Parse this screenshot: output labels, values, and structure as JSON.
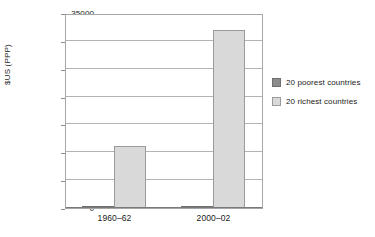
{
  "chart_data": {
    "type": "bar",
    "title": "",
    "xlabel": "",
    "ylabel": "$US (PPP)",
    "categories": [
      "1960–62",
      "2000–02"
    ],
    "series": [
      {
        "name": "20 poorest countries",
        "values": [
          300,
          400
        ],
        "color": "#8c8c8c"
      },
      {
        "name": "20 richest countries",
        "values": [
          11200,
          32000
        ],
        "color": "#d9d9d9"
      }
    ],
    "ylim": [
      0,
      35000
    ],
    "yticks": [
      0,
      5000,
      10000,
      15000,
      20000,
      25000,
      30000,
      35000
    ],
    "ytick_labels": [
      "0",
      "5000",
      "10000",
      "15000",
      "20000",
      "25000",
      "30000",
      "35000"
    ],
    "grid": true,
    "legend_position": "right",
    "background_color": "#ffffff",
    "frame_color": "#a6a6a6",
    "grid_color": "#b3b3b3"
  },
  "legend": {
    "entries": [
      {
        "label": "20 poorest countries",
        "swatch": "poorest"
      },
      {
        "label": "20 richest countries",
        "swatch": "richest"
      }
    ]
  }
}
